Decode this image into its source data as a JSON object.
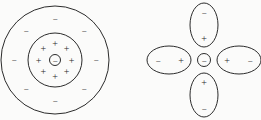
{
  "figure": {
    "background_color": "#fbfbfa",
    "stroke_color": "#2b2b2b",
    "width": 261,
    "height": 120
  },
  "glyphs": {
    "plus": "+",
    "minus": "−"
  },
  "left_diagram": {
    "name": "concentric-charge-shell-diagram",
    "center": {
      "x": 55,
      "y": 60
    },
    "nucleus": {
      "label": "−",
      "radius": 5.5,
      "charge": "negative"
    },
    "inner_circle": {
      "radius": 27,
      "charge_label": "+",
      "charge_count": 8,
      "charge_orbit_radius": 16.5,
      "charge_angles_deg": [
        90,
        45,
        0,
        315,
        270,
        225,
        180,
        135
      ]
    },
    "outer_circle": {
      "radius": 54,
      "charge_label": "−",
      "charge_count": 8,
      "charge_orbit_radius": 41,
      "charge_angles_deg": [
        90,
        45,
        0,
        315,
        270,
        225,
        180,
        135
      ]
    }
  },
  "right_diagram": {
    "name": "dipole-cross-diagram",
    "center": {
      "x": 204,
      "y": 60
    },
    "nucleus": {
      "label": "−",
      "radius": 6.5,
      "charge": "negative"
    },
    "dipoles": [
      {
        "name": "dipole-top",
        "orientation": "vertical",
        "cx": 204,
        "cy": 25,
        "rx": 14,
        "ry": 22,
        "outer_label": "−",
        "inner_label": "+",
        "outer_pos": {
          "x": 204,
          "y": 12
        },
        "inner_pos": {
          "x": 204,
          "y": 38
        }
      },
      {
        "name": "dipole-bottom",
        "orientation": "vertical",
        "cx": 204,
        "cy": 95,
        "rx": 14,
        "ry": 22,
        "outer_label": "−",
        "inner_label": "+",
        "outer_pos": {
          "x": 204,
          "y": 108
        },
        "inner_pos": {
          "x": 204,
          "y": 82
        }
      },
      {
        "name": "dipole-left",
        "orientation": "horizontal",
        "cx": 169,
        "cy": 60,
        "rx": 22,
        "ry": 14,
        "outer_label": "−",
        "inner_label": "+",
        "outer_pos": {
          "x": 158,
          "y": 60
        },
        "inner_pos": {
          "x": 181,
          "y": 60
        }
      },
      {
        "name": "dipole-right",
        "orientation": "horizontal",
        "cx": 239,
        "cy": 60,
        "rx": 22,
        "ry": 14,
        "outer_label": "−",
        "inner_label": "+",
        "outer_pos": {
          "x": 250,
          "y": 60
        },
        "inner_pos": {
          "x": 227,
          "y": 60
        }
      }
    ]
  }
}
